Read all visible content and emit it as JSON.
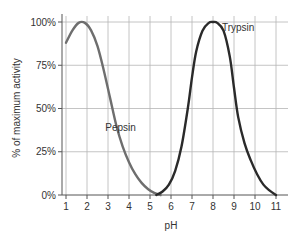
{
  "chart_data": {
    "type": "line",
    "title": "",
    "xlabel": "pH",
    "ylabel": "% of maximum activity",
    "xlim": [
      1,
      11
    ],
    "ylim": [
      0,
      100
    ],
    "x_ticks": [
      "1",
      "2",
      "3",
      "4",
      "5",
      "6",
      "7",
      "8",
      "9",
      "10",
      "11"
    ],
    "y_ticks": [
      "0%",
      "25%",
      "50%",
      "75%",
      "100%"
    ],
    "grid": true,
    "series": [
      {
        "name": "Pepsin",
        "color": "#6e6e6e",
        "x": [
          1.0,
          1.3,
          1.6,
          1.9,
          2.2,
          2.5,
          2.8,
          3.1,
          3.4,
          3.7,
          4.0,
          4.3,
          4.6,
          4.9,
          5.2,
          5.5
        ],
        "y": [
          88,
          95,
          99.5,
          99.5,
          95,
          86,
          72,
          56,
          40,
          28,
          19,
          12,
          7,
          3.5,
          1.2,
          0
        ]
      },
      {
        "name": "Trypsin",
        "color": "#2a2a2a",
        "x": [
          5.3,
          5.6,
          5.9,
          6.2,
          6.5,
          6.8,
          7.0,
          7.2,
          7.5,
          7.8,
          8.0,
          8.2,
          8.5,
          8.8,
          9.0,
          9.2,
          9.5,
          9.8,
          10.1,
          10.4,
          10.7,
          11.0
        ],
        "y": [
          0,
          2,
          6,
          14,
          28,
          50,
          68,
          83,
          95,
          99.5,
          100,
          99.5,
          95,
          80,
          62,
          45,
          30,
          20,
          12,
          6,
          2.5,
          0
        ]
      }
    ],
    "annotations": [
      {
        "text": "Pepsin",
        "x": 3.6,
        "y": 37
      },
      {
        "text": "Trypsin",
        "x": 9.2,
        "y": 95
      }
    ]
  }
}
